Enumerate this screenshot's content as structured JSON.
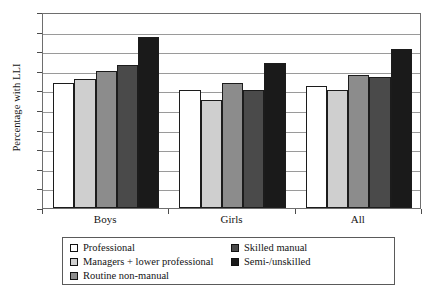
{
  "chart_data": {
    "type": "bar",
    "title": "",
    "xlabel": "",
    "ylabel": "Percentage with LLI",
    "ylim": [
      0,
      10
    ],
    "ytick_step": 1,
    "yticks": [
      0,
      1,
      2,
      3,
      4,
      5,
      6,
      7,
      8,
      9,
      10
    ],
    "ytick_labels": [
      "0",
      "1",
      "2",
      "3",
      "4",
      "5",
      "6",
      "7",
      "8",
      "9",
      "10"
    ],
    "categories": [
      "Boys",
      "Girls",
      "All"
    ],
    "grid": true,
    "grid_axis": "y",
    "legend_position": "bottom",
    "series": [
      {
        "name": "Professional",
        "color": "#ffffff",
        "values": [
          6.4,
          6.0,
          6.2
        ]
      },
      {
        "name": "Managers + lower professional",
        "color": "#cfcfcf",
        "values": [
          6.6,
          5.5,
          6.0
        ]
      },
      {
        "name": "Routine non-manual",
        "color": "#8c8c8c",
        "values": [
          7.0,
          6.4,
          6.8
        ]
      },
      {
        "name": "Skilled manual",
        "color": "#4a4a4a",
        "values": [
          7.3,
          6.0,
          6.7
        ]
      },
      {
        "name": "Semi-/unskilled",
        "color": "#1a1a1a",
        "values": [
          8.75,
          7.4,
          8.1
        ]
      }
    ]
  },
  "axis": {
    "y_title": "Percentage with LLI"
  }
}
